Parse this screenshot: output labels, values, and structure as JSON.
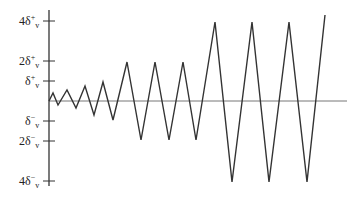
{
  "chart_data": {
    "type": "line",
    "title": "",
    "xlabel": "",
    "ylabel": "",
    "y_ticks": [
      {
        "label": "4δ",
        "sup": "+",
        "sub": "v",
        "value": 4
      },
      {
        "label": "2δ",
        "sup": "+",
        "sub": "v",
        "value": 2
      },
      {
        "label": "δ",
        "sup": "+",
        "sub": "v",
        "value": 1
      },
      {
        "label": "δ",
        "sup": "−",
        "sub": "v",
        "value": -1
      },
      {
        "label": "2δ",
        "sup": "−",
        "sub": "v",
        "value": -2
      },
      {
        "label": "4δ",
        "sup": "−",
        "sub": "v",
        "value": -4
      }
    ],
    "ylim": [
      -4,
      4.4
    ],
    "grid": false,
    "legend": null,
    "series": [
      {
        "name": "displacement",
        "points": [
          [
            0,
            0
          ],
          [
            0.2,
            0.45
          ],
          [
            0.5,
            -0.25
          ],
          [
            0.9,
            0.55
          ],
          [
            1.3,
            -0.4
          ],
          [
            1.7,
            0.75
          ],
          [
            2.1,
            -0.75
          ],
          [
            2.5,
            1.0
          ],
          [
            2.9,
            -1.0
          ],
          [
            3.5,
            2.0
          ],
          [
            4.1,
            -2.0
          ],
          [
            4.7,
            2.0
          ],
          [
            5.3,
            -2.0
          ],
          [
            5.9,
            2.0
          ],
          [
            6.5,
            -2.0
          ],
          [
            7.3,
            4.0
          ],
          [
            8.1,
            -4.0
          ],
          [
            8.9,
            4.0
          ],
          [
            9.7,
            -4.0
          ],
          [
            10.5,
            4.0
          ],
          [
            11.3,
            -4.0
          ],
          [
            12.1,
            4.35
          ]
        ]
      }
    ]
  },
  "geometry": {
    "axis_x": 49,
    "axis_top": 10,
    "axis_bottom": 186,
    "baseline_y": 101,
    "baseline_end": 347,
    "scale_px_per_unit": 19.9
  },
  "wave_pixels": [
    [
      49,
      101
    ],
    [
      53,
      93
    ],
    [
      58,
      105
    ],
    [
      67,
      90
    ],
    [
      76,
      108
    ],
    [
      85,
      86
    ],
    [
      94,
      115
    ],
    [
      103,
      82
    ],
    [
      113,
      120
    ],
    [
      127,
      62
    ],
    [
      141,
      140
    ],
    [
      155,
      62
    ],
    [
      169,
      140
    ],
    [
      183,
      62
    ],
    [
      196,
      140
    ],
    [
      215,
      22
    ],
    [
      232,
      182
    ],
    [
      252,
      22
    ],
    [
      269,
      182
    ],
    [
      289,
      22
    ],
    [
      307,
      182
    ],
    [
      325,
      15
    ]
  ]
}
